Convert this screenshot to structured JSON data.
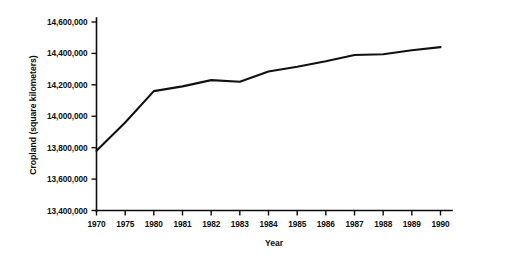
{
  "chart_data": {
    "type": "line",
    "title": "",
    "xlabel": "Year",
    "ylabel": "Cropland (square kilometers)",
    "x": [
      1970,
      1975,
      1980,
      1981,
      1982,
      1983,
      1984,
      1985,
      1986,
      1987,
      1988,
      1989,
      1990
    ],
    "categories": [
      "1970",
      "1975",
      "1980",
      "1981",
      "1982",
      "1983",
      "1984",
      "1985",
      "1986",
      "1987",
      "1988",
      "1989",
      "1990"
    ],
    "values": [
      13780000,
      13960000,
      14160000,
      14190000,
      14230000,
      14220000,
      14285000,
      14315000,
      14350000,
      14390000,
      14395000,
      14420000,
      14440000
    ],
    "series": [
      {
        "name": "Cropland",
        "values": [
          13780000,
          13960000,
          14160000,
          14190000,
          14230000,
          14220000,
          14285000,
          14315000,
          14350000,
          14390000,
          14395000,
          14420000,
          14440000
        ]
      }
    ],
    "ylim": [
      13400000,
      14600000
    ],
    "ytick_values": [
      13400000,
      13600000,
      13800000,
      14000000,
      14200000,
      14400000,
      14600000
    ],
    "ytick_labels": [
      "13,400,000",
      "13,600,000",
      "13,800,000",
      "14,000,000",
      "14,200,000",
      "14,400,000",
      "14,600,000"
    ],
    "xtick_labels": [
      "1970",
      "1975",
      "1980",
      "1981",
      "1982",
      "1983",
      "1984",
      "1985",
      "1986",
      "1987",
      "1988",
      "1989",
      "1990"
    ],
    "grid": false,
    "legend": null,
    "legend_position": "none",
    "line_color": "#111111",
    "axis_color": "#0d0d0d",
    "background_color": "#ffffff"
  }
}
